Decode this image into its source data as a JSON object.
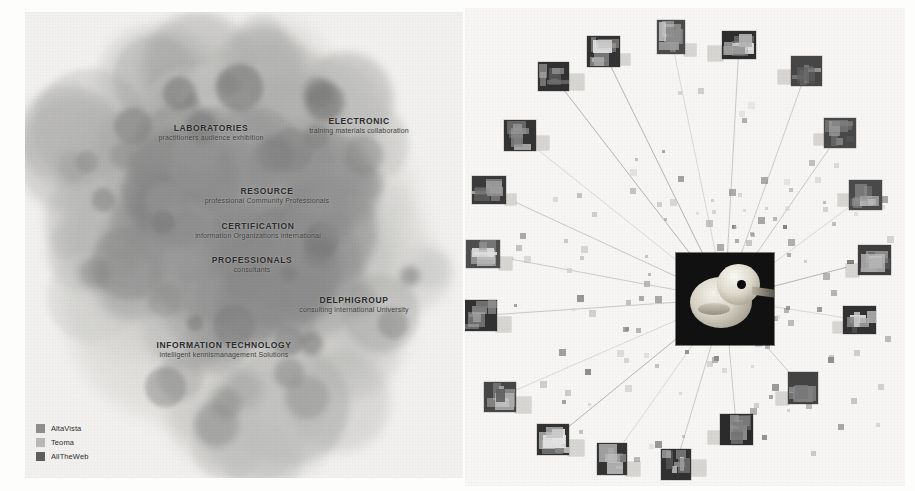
{
  "figure": {
    "title": "",
    "panels": [
      "cluster-map",
      "image-network"
    ]
  },
  "left_panel": {
    "name": "search-engine-cluster-map",
    "background_color": "#f2f1ef",
    "clusters": [
      {
        "title": "LABORATORIES",
        "subtitle": "practitioners audience exhibition",
        "x": 211,
        "y": 133
      },
      {
        "title": "ELECTRONIC",
        "subtitle": "training materials collaboration",
        "x": 359,
        "y": 126
      },
      {
        "title": "RESOURCE",
        "subtitle": "professional Community Professionals",
        "x": 267,
        "y": 196
      },
      {
        "title": "CERTIFICATION",
        "subtitle": "information Organizations international",
        "x": 258,
        "y": 231
      },
      {
        "title": "PROFESSIONALS",
        "subtitle": "consultants",
        "x": 252,
        "y": 265
      },
      {
        "title": "DELPHIGROUP",
        "subtitle": "consulting international University",
        "x": 354,
        "y": 305
      },
      {
        "title": "INFORMATION TECHNOLOGY",
        "subtitle": "intelligent kennismanagement Solutions",
        "x": 224,
        "y": 350
      }
    ],
    "legend": {
      "name": "search-engine-legend",
      "items": [
        {
          "label": "AltaVista",
          "color": "#8d8d8d"
        },
        {
          "label": "Teoma",
          "color": "#b9b9b9"
        },
        {
          "label": "AllTheWeb",
          "color": "#5e5e5e"
        }
      ]
    }
  },
  "right_panel": {
    "name": "image-similarity-network",
    "background_color": "#f7f6f4",
    "center_image": {
      "name": "rubber-duck-photo",
      "description": "rubber duck",
      "x": 676,
      "y": 253,
      "width": 98,
      "height": 92
    },
    "node_count": 28,
    "scatter_dot_count": 210,
    "thumbnails": [
      {
        "description": "rubber duck",
        "x": 587,
        "y": 36,
        "w": 33,
        "h": 31
      },
      {
        "description": "toy figure",
        "x": 657,
        "y": 20,
        "w": 28,
        "h": 34
      },
      {
        "description": "text banner",
        "x": 722,
        "y": 31,
        "w": 34,
        "h": 28
      },
      {
        "description": "dark frame",
        "x": 791,
        "y": 56,
        "w": 31,
        "h": 30
      },
      {
        "description": "teacup",
        "x": 824,
        "y": 118,
        "w": 32,
        "h": 30
      },
      {
        "description": "white dome",
        "x": 849,
        "y": 180,
        "w": 33,
        "h": 30
      },
      {
        "description": "dark texture",
        "x": 858,
        "y": 245,
        "w": 33,
        "h": 30
      },
      {
        "description": "label card",
        "x": 843,
        "y": 306,
        "w": 33,
        "h": 28
      },
      {
        "description": "bottle",
        "x": 788,
        "y": 372,
        "w": 30,
        "h": 32
      },
      {
        "description": "dark photo",
        "x": 720,
        "y": 414,
        "w": 33,
        "h": 31
      },
      {
        "description": "grey vase",
        "x": 661,
        "y": 449,
        "w": 30,
        "h": 31
      },
      {
        "description": "grey cup",
        "x": 597,
        "y": 443,
        "w": 30,
        "h": 32
      },
      {
        "description": "paper sheet",
        "x": 537,
        "y": 424,
        "w": 32,
        "h": 31
      },
      {
        "description": "dark label",
        "x": 484,
        "y": 382,
        "w": 32,
        "h": 30
      },
      {
        "description": "portrait",
        "x": 465,
        "y": 300,
        "w": 32,
        "h": 31
      },
      {
        "description": "landscape",
        "x": 466,
        "y": 240,
        "w": 34,
        "h": 28
      },
      {
        "description": "landscape",
        "x": 472,
        "y": 176,
        "w": 34,
        "h": 28
      },
      {
        "description": "bright blob",
        "x": 504,
        "y": 120,
        "w": 32,
        "h": 31
      },
      {
        "description": "dark square",
        "x": 538,
        "y": 62,
        "w": 31,
        "h": 29
      }
    ]
  }
}
